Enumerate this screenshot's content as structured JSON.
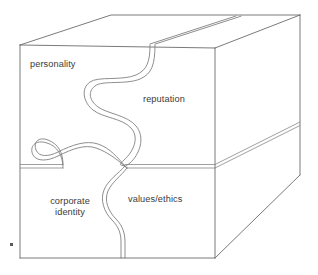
{
  "diagram": {
    "type": "isometric-box-puzzle",
    "background_color": "#ffffff",
    "line_color": "#6b6b6b",
    "text_color": "#3a3a3a",
    "labels": {
      "personality": "personality",
      "reputation": "reputation",
      "corporate_identity": "corporate\nidentity",
      "values_ethics": "values/ethics"
    },
    "marker": {
      "name": "corner-dot",
      "color": "#5a5a5a"
    },
    "faces": [
      {
        "name": "front-upper-left",
        "label": "personality"
      },
      {
        "name": "front-upper-right",
        "label": "reputation"
      },
      {
        "name": "front-lower-left",
        "label": "corporate identity"
      },
      {
        "name": "front-lower-right",
        "label": "values/ethics"
      },
      {
        "name": "top-face",
        "label": ""
      },
      {
        "name": "right-side-face",
        "label": ""
      }
    ]
  }
}
